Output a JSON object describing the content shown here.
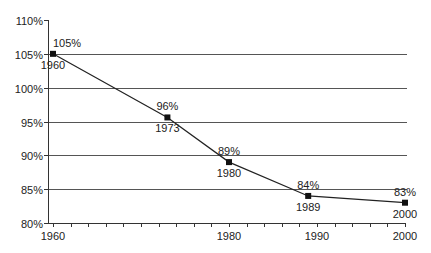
{
  "chart_data": {
    "type": "line",
    "title": "",
    "xlabel": "",
    "ylabel": "",
    "x": [
      1960,
      1973,
      1980,
      1989,
      2000
    ],
    "series": [
      {
        "name": "value",
        "values": [
          105,
          95.6,
          89,
          84,
          83
        ],
        "point_labels": [
          "105%",
          "96%",
          "89%",
          "84%",
          "83%"
        ],
        "year_labels": [
          "1960",
          "1973",
          "1980",
          "1989",
          "2000"
        ]
      }
    ],
    "xlim": [
      1960,
      2000
    ],
    "ylim": [
      80,
      110
    ],
    "x_ticks": [
      1960,
      1980,
      1990,
      2000
    ],
    "x_tick_labels": [
      "1960",
      "1980",
      "1990",
      "2000"
    ],
    "x_minor_tick_step": 2,
    "y_ticks": [
      80,
      85,
      90,
      95,
      100,
      105,
      110
    ],
    "y_tick_labels": [
      "80%",
      "85%",
      "90%",
      "95%",
      "100%",
      "105%",
      "110%"
    ],
    "grid": "horizontal",
    "legend": "none",
    "colors": {
      "line": "#222222",
      "grid": "#555555",
      "marker": "#111111"
    }
  }
}
